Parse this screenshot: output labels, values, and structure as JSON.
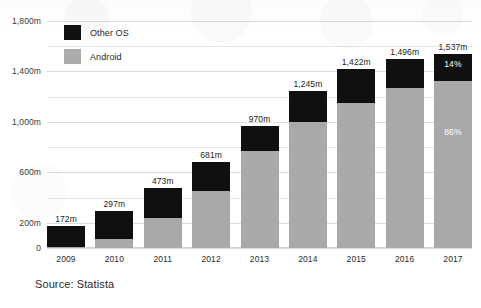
{
  "chart_data": {
    "type": "bar",
    "subtype": "stacked-bar",
    "title": "",
    "subtitle": "",
    "xlabel": "",
    "ylabel": "",
    "categories": [
      "2009",
      "2010",
      "2011",
      "2012",
      "2013",
      "2014",
      "2015",
      "2016",
      "2017"
    ],
    "series": [
      {
        "name": "Android",
        "color": "#a9a9a9",
        "values": [
          7,
          68,
          236,
          450,
          766,
          996,
          1152,
          1272,
          1322
        ]
      },
      {
        "name": "Other OS",
        "color": "#101010",
        "values": [
          165,
          229,
          237,
          231,
          204,
          249,
          270,
          224,
          215
        ]
      }
    ],
    "totals": [
      172,
      297,
      473,
      681,
      970,
      1245,
      1422,
      1496,
      1537
    ],
    "total_labels": [
      "172m",
      "297m",
      "473m",
      "681m",
      "970m",
      "1,245m",
      "1,422m",
      "1,496m",
      "1,537m"
    ],
    "ylim": [
      0,
      1800
    ],
    "ytick_values": [
      0,
      200,
      400,
      600,
      800,
      1000,
      1200,
      1400,
      1600,
      1800
    ],
    "ytick_labels": [
      "0",
      "200m",
      "",
      "600m",
      "",
      "1,000m",
      "",
      "1,400m",
      "",
      "1,800m"
    ],
    "grid": true,
    "legend_position": "top-left",
    "units": "millions of units",
    "annotations": [
      {
        "category": "2017",
        "series": "Other OS",
        "text": "14%"
      },
      {
        "category": "2017",
        "series": "Android",
        "text": "86%"
      }
    ]
  },
  "legend": {
    "items": [
      {
        "label": "Other OS",
        "color": "#101010"
      },
      {
        "label": "Android",
        "color": "#a9a9a9"
      }
    ]
  },
  "footer": {
    "source": "Source: Statista"
  }
}
